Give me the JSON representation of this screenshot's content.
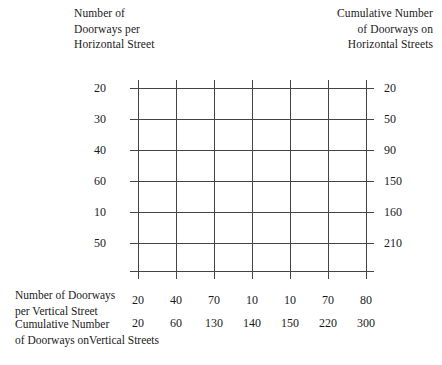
{
  "figure": {
    "caption_top_left": "Number of\nDoorways per\nHorizontal Street",
    "caption_top_right": "Cumulative Number\nof Doorways on\nHorizontal Streets",
    "caption_bottom_row1": "Number of Doorways\nper Vertical Street",
    "caption_bottom_row2": "Cumulative Number\n of Doorways onVertical Streets",
    "grid_color": "#454545",
    "background_color": "#ffffff"
  },
  "chart_data": {
    "type": "table",
    "title": "",
    "xlabel": "Number of Doorways per Vertical Street",
    "ylabel": "Number of Doorways per Horizontal Street",
    "grid": true,
    "rows": 6,
    "columns": 7,
    "row_values": [
      20,
      30,
      40,
      60,
      10,
      50
    ],
    "row_cumulative": [
      20,
      50,
      90,
      150,
      160,
      210
    ],
    "column_values": [
      20,
      40,
      70,
      10,
      10,
      70,
      80
    ],
    "column_cumulative": [
      20,
      60,
      130,
      140,
      150,
      220,
      300
    ],
    "row_labels_left": [
      "20",
      "30",
      "40",
      "60",
      "10",
      "50"
    ],
    "row_labels_right": [
      "20",
      "50",
      "90",
      "150",
      "160",
      "210"
    ],
    "column_labels": [
      "20",
      "40",
      "70",
      "10",
      "10",
      "70",
      "80"
    ],
    "column_cumulative_labels": [
      "20",
      "60",
      "130",
      "140",
      "150",
      "220",
      "300"
    ]
  }
}
